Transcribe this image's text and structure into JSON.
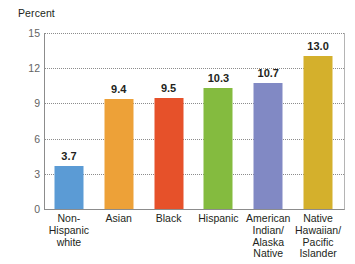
{
  "chart_data": {
    "type": "bar",
    "title": "",
    "subtitle": "",
    "xlabel": "",
    "ylabel": "Percent",
    "ylim": [
      0,
      15
    ],
    "yticks": [
      0,
      3,
      6,
      9,
      12,
      15
    ],
    "grid": true,
    "legend": "none",
    "categories": [
      "Non-\nHispanic\nwhite",
      "Asian",
      "Black",
      "Hispanic",
      "American\nIndian/\nAlaska\nNative",
      "Native\nHawaiian/\nPacific\nIslander"
    ],
    "values": [
      3.7,
      9.4,
      9.5,
      10.3,
      10.7,
      13.0
    ],
    "value_labels": [
      "3.7",
      "9.4",
      "9.5",
      "10.3",
      "10.7",
      "13.0"
    ],
    "colors": [
      "#5b9bd5",
      "#eda138",
      "#e6512a",
      "#84bb3f",
      "#8189c4",
      "#d4b02c"
    ],
    "axis_color": "#8c8c8c",
    "gridline_color": "#8c8c8c",
    "tick_label_color": "#636363"
  },
  "axis": {
    "y_title": "Percent",
    "tick_labels": [
      "15",
      "12",
      "9",
      "6",
      "3",
      "0"
    ]
  }
}
